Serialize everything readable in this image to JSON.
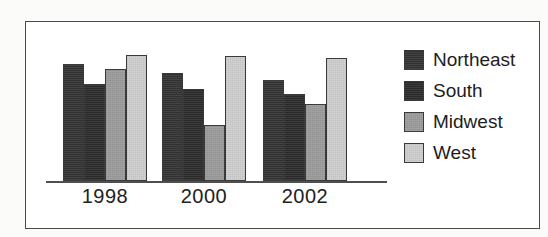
{
  "chart_data": {
    "type": "bar",
    "title": "",
    "subtitle": "",
    "xlabel": "",
    "ylabel": "",
    "grid": false,
    "legend_position": "right",
    "axis": {
      "y_visible": false,
      "x_visible": true,
      "ylim": [
        0,
        100
      ]
    },
    "categories": [
      "1998",
      "2000",
      "2002"
    ],
    "series": [
      {
        "name": "Northeast",
        "color": "#333333",
        "values": [
          90,
          83,
          78
        ]
      },
      {
        "name": "South",
        "color": "#2b2b2b",
        "values": [
          75,
          71,
          67
        ]
      },
      {
        "name": "Midwest",
        "color": "#9a9a9a",
        "values": [
          86,
          43,
          59
        ]
      },
      {
        "name": "West",
        "color": "#cdcdcd",
        "values": [
          97,
          96,
          95
        ]
      }
    ]
  },
  "legend": {
    "items": [
      {
        "label": "Northeast",
        "swatch": "legend-swatch-northeast"
      },
      {
        "label": "South",
        "swatch": "legend-swatch-south"
      },
      {
        "label": "Midwest",
        "swatch": "legend-swatch-midwest"
      },
      {
        "label": "West",
        "swatch": "legend-swatch-west"
      }
    ]
  },
  "colors": {
    "northeast": "#333333",
    "south": "#2b2b2b",
    "midwest": "#9a9a9a",
    "west": "#cdcdcd",
    "frame_border": "#4a4a4a",
    "axis_line": "#4f4f4f",
    "plot_background": "#ffffff",
    "page_background": "#fbfbfa",
    "text": "#1d1d1d"
  }
}
